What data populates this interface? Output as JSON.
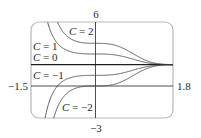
{
  "chart_data": {
    "type": "line",
    "title": "",
    "xlabel": "",
    "ylabel": "",
    "xlim": [
      -1.5,
      1.8
    ],
    "ylim": [
      -3,
      6
    ],
    "grid": false,
    "legend": "inline labels",
    "function": "y = 2 + C·e^(-x^3)",
    "tick_labels": {
      "x_min": "−1.5",
      "x_max": "1.8",
      "y_max": "6",
      "y_min": "−3"
    },
    "series": [
      {
        "name": "C = 2",
        "C": 2,
        "plateau_at_x0": 4
      },
      {
        "name": "C = 1",
        "C": 1,
        "plateau_at_x0": 3
      },
      {
        "name": "C = 0",
        "C": 0,
        "plateau_at_x0": 2
      },
      {
        "name": "C = −1",
        "C": -1,
        "plateau_at_x0": 1
      },
      {
        "name": "C = −2",
        "C": -2,
        "plateau_at_x0": 0
      }
    ],
    "annotations": [
      {
        "text_var": "C",
        "text_rest": " = 2",
        "x": 66,
        "y": 35
      },
      {
        "text_var": "C",
        "text_rest": " = 1",
        "x": 33,
        "y": 50
      },
      {
        "text_var": "C",
        "text_rest": " = 0",
        "x": 33,
        "y": 61
      },
      {
        "text_var": "C",
        "text_rest": " = −1",
        "x": 33,
        "y": 78
      },
      {
        "text_var": "C",
        "text_rest": " = −2",
        "x": 62,
        "y": 111
      }
    ],
    "asymptote_y": 2
  },
  "labels": {
    "y_top": "6",
    "y_bottom": "−3",
    "x_left": "−1.5",
    "x_right": "1.8",
    "c2": {
      "var": "C",
      "rest": " = 2"
    },
    "c1": {
      "var": "C",
      "rest": " = 1"
    },
    "c0": {
      "var": "C",
      "rest": " = 0"
    },
    "cm1": {
      "var": "C",
      "rest": " = −1"
    },
    "cm2": {
      "var": "C",
      "rest": " = −2"
    }
  },
  "colors": {
    "frame": "#b8b8b8",
    "axis": "#3a3a3a",
    "curve": "#4a4a4a",
    "asymptote": "#1e1e1e",
    "text": "#2a2a2a"
  }
}
